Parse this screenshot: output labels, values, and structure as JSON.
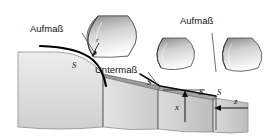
{
  "figure": {
    "background_color": "#ffffff",
    "width": 276,
    "height": 139
  },
  "labels": {
    "aufmass_left": "Aufmaß",
    "aufmass_right": "Aufmaß",
    "untermass": "Untermaß",
    "s_left": "S",
    "s_mid": "S",
    "s_right_a": "S",
    "s_right_b": "S",
    "radius": "r",
    "dim_x": "x",
    "dim_z": "z"
  },
  "colors": {
    "outline": "#1a1a1a",
    "workpiece_fill_light": "#efefef",
    "workpiece_fill_mid": "#d8d8d8",
    "workpiece_fill_dark": "#bdbdbd",
    "tool_fill_light": "#fbfbfb",
    "tool_fill_dark": "#8e8e8e",
    "leader_line": "#4a4a4a",
    "bold_contour": "#000000"
  },
  "elements": {
    "tool_left": "cutting-tool-wedge",
    "tool_middle": "cutting-tool-wedge",
    "tool_right": "cutting-tool-wedge",
    "workpiece": "stepped-workpiece-profile",
    "contour_curve": "rounded-corner-contour",
    "radius_arrow": "radius-dimension-arrow",
    "x_arrow": "x-dimension-arrow",
    "z_arrow": "z-dimension-arrow"
  }
}
